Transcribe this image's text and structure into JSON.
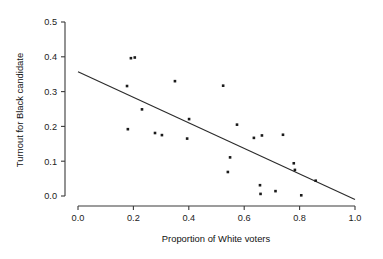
{
  "chart_data": {
    "type": "scatter",
    "title": "",
    "xlabel": "Proportion of White voters",
    "ylabel": "Turnout for Black candidate",
    "xlim": [
      0.0,
      1.0
    ],
    "ylim": [
      0.0,
      0.5
    ],
    "xticks": [
      "0.0",
      "0.2",
      "0.4",
      "0.6",
      "0.8",
      "1.0"
    ],
    "xtick_values": [
      0.0,
      0.2,
      0.4,
      0.6,
      0.8,
      1.0
    ],
    "yticks": [
      "0.0",
      "0.1",
      "0.2",
      "0.3",
      "0.4",
      "0.5"
    ],
    "ytick_values": [
      0.0,
      0.1,
      0.2,
      0.3,
      0.4,
      0.5
    ],
    "grid": false,
    "legend": "none",
    "marker": "small-filled-square",
    "marker_color": "#1a1a1a",
    "points": [
      {
        "x": 0.177,
        "y": 0.316
      },
      {
        "x": 0.18,
        "y": 0.192
      },
      {
        "x": 0.191,
        "y": 0.396
      },
      {
        "x": 0.205,
        "y": 0.398
      },
      {
        "x": 0.231,
        "y": 0.249
      },
      {
        "x": 0.278,
        "y": 0.181
      },
      {
        "x": 0.303,
        "y": 0.175
      },
      {
        "x": 0.35,
        "y": 0.33
      },
      {
        "x": 0.394,
        "y": 0.165
      },
      {
        "x": 0.401,
        "y": 0.221
      },
      {
        "x": 0.524,
        "y": 0.317
      },
      {
        "x": 0.541,
        "y": 0.069
      },
      {
        "x": 0.549,
        "y": 0.111
      },
      {
        "x": 0.574,
        "y": 0.205
      },
      {
        "x": 0.635,
        "y": 0.167
      },
      {
        "x": 0.657,
        "y": 0.031
      },
      {
        "x": 0.659,
        "y": 0.006
      },
      {
        "x": 0.664,
        "y": 0.174
      },
      {
        "x": 0.713,
        "y": 0.014
      },
      {
        "x": 0.74,
        "y": 0.176
      },
      {
        "x": 0.779,
        "y": 0.094
      },
      {
        "x": 0.783,
        "y": 0.075
      },
      {
        "x": 0.806,
        "y": 0.002
      },
      {
        "x": 0.858,
        "y": 0.044
      }
    ],
    "fit_line": {
      "type": "linear-regression",
      "x_start": 0.0,
      "y_start": 0.357,
      "x_end": 1.0,
      "y_end": -0.01,
      "slope": -0.367,
      "intercept": 0.357,
      "color": "#2b2b2b"
    }
  }
}
